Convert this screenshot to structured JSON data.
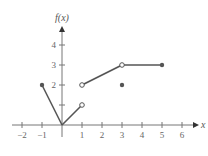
{
  "chart_data": {
    "type": "line",
    "title": "",
    "xlabel": "x",
    "ylabel": "f(x)",
    "xlim": [
      -2.5,
      6.8
    ],
    "ylim": [
      -0.5,
      4.8
    ],
    "x_ticks": [
      -2,
      -1,
      1,
      2,
      3,
      4,
      5,
      6
    ],
    "y_ticks": [
      1,
      2,
      3,
      4
    ],
    "x_tick_labels": [
      "−2",
      "−1",
      "1",
      "2",
      "3",
      "4",
      "5",
      "6"
    ],
    "y_tick_labels": [
      "",
      "2",
      "3",
      "4"
    ],
    "grid": false,
    "segments": [
      {
        "from": [
          -1,
          2
        ],
        "to": [
          0,
          0
        ]
      },
      {
        "from": [
          0,
          0
        ],
        "to": [
          1,
          1
        ]
      },
      {
        "from": [
          1,
          2
        ],
        "to": [
          3,
          3
        ]
      },
      {
        "from": [
          3,
          3
        ],
        "to": [
          5,
          3
        ]
      }
    ],
    "closed_points": [
      [
        -1,
        2
      ],
      [
        3,
        2
      ],
      [
        5,
        3
      ]
    ],
    "open_points": [
      [
        1,
        1
      ],
      [
        1,
        2
      ],
      [
        3,
        3
      ]
    ],
    "colors": {
      "line": "#555555",
      "axis": "#777777"
    }
  }
}
